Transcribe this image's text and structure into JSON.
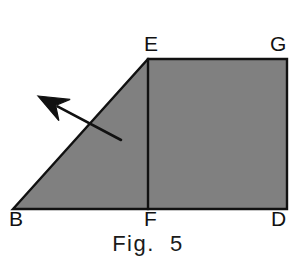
{
  "figure": {
    "caption": "Fig.  5",
    "background_color": "#ffffff",
    "fill_color": "#808080",
    "stroke_color": "#111111",
    "stroke_width": 2.4,
    "canvas": {
      "width": 296,
      "height": 262
    }
  },
  "labels": {
    "E": "E",
    "G": "G",
    "B": "B",
    "F": "F",
    "D": "D"
  },
  "geometry": {
    "description": "Shaded trapezoid B-E-G-D formed by right triangle B-E-F joined to square E-G-D-F",
    "points": {
      "B": {
        "x": 13,
        "y": 209
      },
      "E": {
        "x": 148,
        "y": 59
      },
      "G": {
        "x": 287,
        "y": 59
      },
      "D": {
        "x": 287,
        "y": 209
      },
      "F": {
        "x": 148,
        "y": 209
      }
    },
    "outline_path": "M 13 209 L 148 59 L 287 59 L 287 209 Z",
    "interior_segment": {
      "name": "EF",
      "from": "E",
      "to": "F"
    }
  },
  "annotation": {
    "arrow": {
      "name": "direction-arrow",
      "tail": {
        "x": 121,
        "y": 140
      },
      "tip": {
        "x": 38,
        "y": 96
      },
      "points_toward": "upper-left",
      "color": "#111111",
      "shaft_width": 2.6,
      "head_style": "swallowtail"
    }
  }
}
